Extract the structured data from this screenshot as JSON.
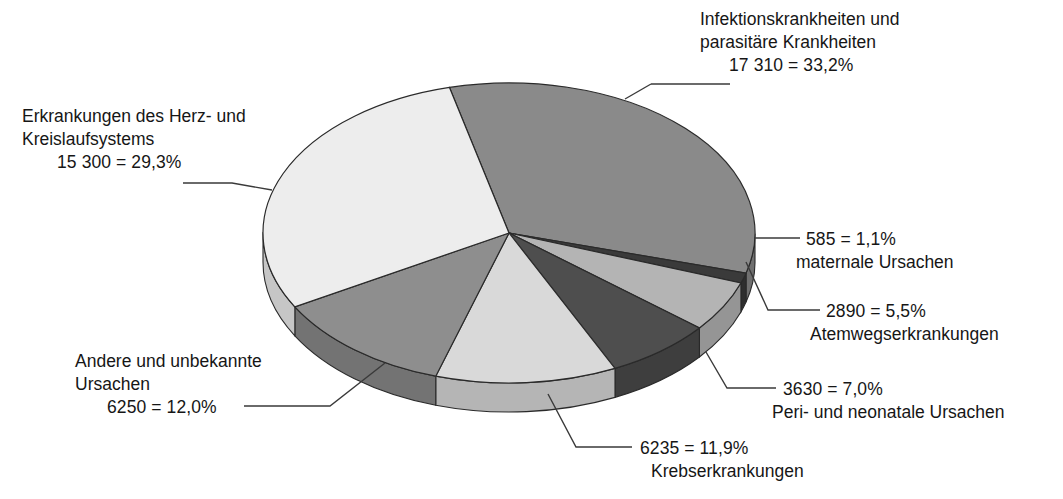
{
  "chart_data": {
    "type": "pie",
    "title": "",
    "subtitle": "",
    "xlabel": "",
    "ylabel": "",
    "legend_position": "callout-labels",
    "grid": false,
    "style": "3d-pie",
    "total": 52200,
    "value_unit": "absolute count",
    "categories": [
      "Infektionskrankheiten und parasitäre Krankheiten",
      "maternale Ursachen",
      "Atemwegserkrankungen",
      "Peri- und neonatale Ursachen",
      "Krebserkrankungen",
      "Andere und unbekannte Ursachen",
      "Erkrankungen des Herz- und Kreislaufsystems"
    ],
    "values": [
      17310,
      585,
      2890,
      3630,
      6235,
      6250,
      15300
    ],
    "percentages": [
      33.2,
      1.1,
      5.5,
      7.0,
      11.9,
      12.0,
      29.3
    ],
    "colors": [
      "#8a8a8a",
      "#3a3a3a",
      "#b4b4b4",
      "#4e4e4e",
      "#d9d9d9",
      "#8e8e8e",
      "#ededed"
    ],
    "side_colors": [
      "#6f6f6f",
      "#2e2e2e",
      "#959595",
      "#3e3e3e",
      "#b5b5b5",
      "#737373",
      "#c6c6c6"
    ]
  },
  "geometry": {
    "cx": 509,
    "cy": 233,
    "rx": 246,
    "ry": 150,
    "depth": 29,
    "start_angle_deg": -104
  },
  "labels": {
    "infektions": {
      "line1": "Infektionskrankheiten und",
      "line2": "parasitäre Krankheiten",
      "value": "17 310 = 33,2%"
    },
    "herz": {
      "line1": "Erkrankungen des Herz- und",
      "line2": "Kreislaufsystems",
      "value": "15 300 = 29,3%"
    },
    "maternale": {
      "value": "585 = 1,1%",
      "name": "maternale Ursachen"
    },
    "atemwege": {
      "value": "2890 = 5,5%",
      "name": "Atemwegserkrankungen"
    },
    "perinatal": {
      "value": "3630 = 7,0%",
      "name": "Peri- und neonatale Ursachen"
    },
    "krebs": {
      "value": "6235 = 11,9%",
      "name": "Krebserkrankungen"
    },
    "andere": {
      "line1": "Andere und unbekannte",
      "line2": "Ursachen",
      "value": "6250 = 12,0%"
    }
  }
}
